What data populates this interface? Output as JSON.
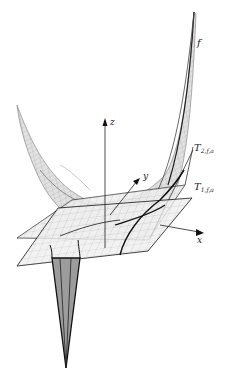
{
  "figure": {
    "axes": {
      "x_label": "x",
      "y_label": "y",
      "z_label": "z"
    },
    "surfaces": {
      "f_label": "f",
      "t2_label_main": "T",
      "t2_label_sub": "2,f,a",
      "t1_label_main": "T",
      "t1_label_sub": "1,f,a"
    },
    "colors": {
      "surface_stroke": "#555555",
      "surface_fill": "#d8d8d8",
      "plane_fill": "#ececec",
      "spike_fill": "#9a9a9a",
      "edge": "#111111",
      "background": "#ffffff"
    }
  }
}
